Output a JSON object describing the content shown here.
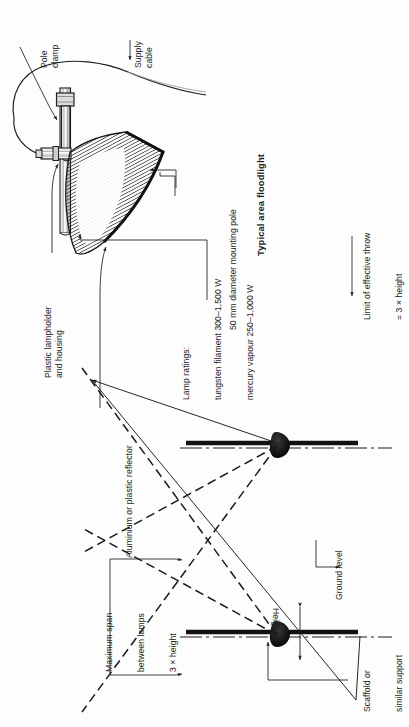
{
  "figure": {
    "title": "Typical area floodlight",
    "orientation": "rotated-90-ccw",
    "background_color": "#fdfdfd",
    "ink_color": "#1a1a1a"
  },
  "upper_diagram": {
    "name": "floodlight-fixture-detail",
    "caption": "Typical area floodlight",
    "labels": {
      "pole_clamp": "Pole\nclamp",
      "supply_cable": "Supply\ncable",
      "lampholder": "Plastic lampholder\nand housing",
      "reflector": "Aluminium or plastic reflector",
      "lamp_ratings_line1": "Lamp ratings:",
      "lamp_ratings_line2": "tungsten filament 300–1,500 W",
      "lamp_ratings_line3": "mercury vapour 250–1,000 W",
      "mounting_pole": "50 mm diameter mounting pole"
    }
  },
  "lower_diagram": {
    "name": "floodlight-throw-geometry",
    "labels": {
      "limit_of_throw_line1": "Limit of effective throw",
      "limit_of_throw_line2": "= 3 × height",
      "ground_level": "Ground level",
      "height": "Height",
      "scaffold_line1": "Scaffold or",
      "scaffold_line2": "similar support",
      "max_span_line1": "Maximum span",
      "max_span_line2": "between lamps",
      "max_span_line3": "3 × height"
    }
  }
}
